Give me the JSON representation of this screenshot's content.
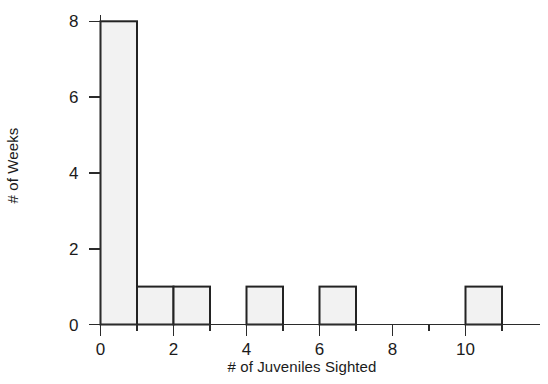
{
  "chart_data": {
    "type": "bar",
    "title": "",
    "subtitle": "",
    "xlabel": "# of Juveniles Sighted",
    "ylabel": "# of Weeks",
    "bin_width": 1,
    "bin_edges": [
      0,
      1,
      2,
      3,
      4,
      5,
      6,
      7,
      8,
      9,
      10,
      11
    ],
    "categories": [
      "0-1",
      "1-2",
      "2-3",
      "3-4",
      "4-5",
      "5-6",
      "6-7",
      "7-8",
      "8-9",
      "9-10",
      "10-11"
    ],
    "values": [
      8,
      1,
      1,
      0,
      1,
      0,
      1,
      0,
      0,
      0,
      1
    ],
    "bars": [
      {
        "start": 0,
        "end": 1,
        "value": 8
      },
      {
        "start": 1,
        "end": 2,
        "value": 1
      },
      {
        "start": 2,
        "end": 3,
        "value": 1
      },
      {
        "start": 3,
        "end": 4,
        "value": 0
      },
      {
        "start": 4,
        "end": 5,
        "value": 1
      },
      {
        "start": 5,
        "end": 6,
        "value": 0
      },
      {
        "start": 6,
        "end": 7,
        "value": 1
      },
      {
        "start": 7,
        "end": 8,
        "value": 0
      },
      {
        "start": 8,
        "end": 9,
        "value": 0
      },
      {
        "start": 9,
        "end": 10,
        "value": 0
      },
      {
        "start": 10,
        "end": 11,
        "value": 1
      }
    ],
    "xlim": [
      0,
      12
    ],
    "ylim": [
      0,
      8
    ],
    "x_tick_labels": [
      "0",
      "2",
      "4",
      "6",
      "8",
      "10"
    ],
    "x_tick_values": [
      0,
      2,
      4,
      6,
      8,
      10
    ],
    "x_minor_tick_values": [
      1,
      3,
      5,
      7,
      9,
      11
    ],
    "y_tick_labels": [
      "0",
      "2",
      "4",
      "6",
      "8"
    ],
    "y_tick_values": [
      0,
      2,
      4,
      6,
      8
    ],
    "grid": false,
    "legend": null,
    "bar_fill_color": "#f2f2f2",
    "bar_edge_color": "#232323",
    "axis_color": "#2b2b2b",
    "background_color": "#ffffff"
  }
}
